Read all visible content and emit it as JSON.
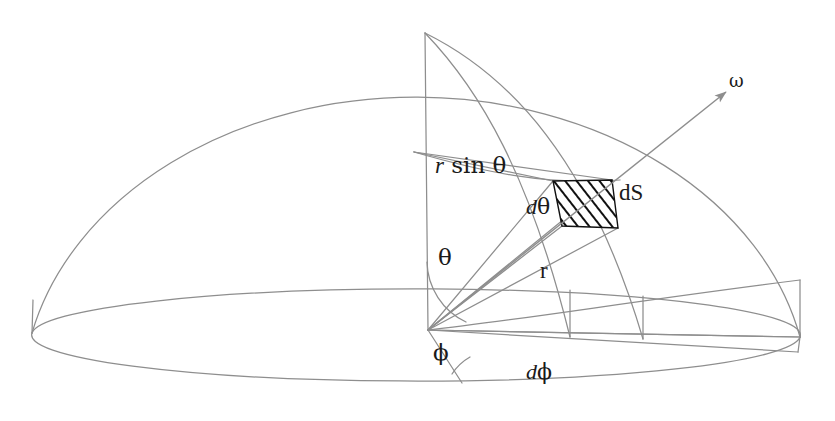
{
  "figure": {
    "kind": "solid-angle-hemisphere-diagram",
    "background_color": "#ffffff",
    "line_color": "#8e8e8e",
    "hatch_color": "#111111",
    "label_color": "#1a1a1a"
  },
  "labels": {
    "r_sin_theta": {
      "italic_part": "r",
      "upright_part": " sin θ"
    },
    "d_theta": {
      "italic_part": "d",
      "upright_part": "θ"
    },
    "dS": {
      "italic_part": "dS",
      "upright_part": ""
    },
    "theta": {
      "text": "θ"
    },
    "r": {
      "text": "r"
    },
    "phi": {
      "text": "ϕ"
    },
    "d_phi": {
      "italic_part": "d",
      "upright_part": "ϕ"
    },
    "omega": {
      "text": "ω"
    }
  },
  "geometry": {
    "apex": {
      "x": 425,
      "y": 33
    },
    "origin": {
      "x": 428,
      "y": 330
    },
    "base_ellipse": {
      "cx": 416,
      "cy": 335,
      "rx": 384,
      "ry": 46
    },
    "dome_rx": 393,
    "dome_ry": 302,
    "patch_corners": [
      {
        "x": 553,
        "y": 181
      },
      {
        "x": 612,
        "y": 180
      },
      {
        "x": 618,
        "y": 228
      },
      {
        "x": 562,
        "y": 226
      }
    ],
    "omega_arrow": {
      "from_x": 428,
      "from_y": 330,
      "to_x": 726,
      "to_y": 92
    }
  }
}
